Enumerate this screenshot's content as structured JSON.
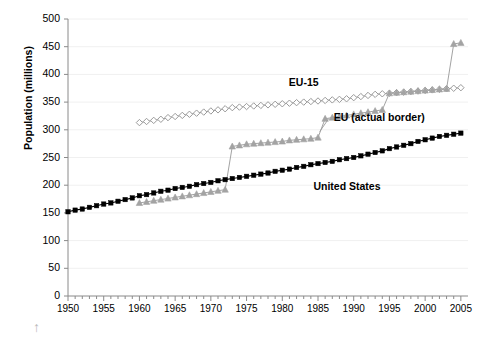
{
  "chart_data": {
    "type": "line",
    "title": "",
    "subtitle": "",
    "xlabel": "",
    "ylabel": "Population (millions)",
    "xlim": [
      1950,
      2006
    ],
    "ylim": [
      0,
      500
    ],
    "ytick_labels": [
      "0",
      "50",
      "100",
      "150",
      "200",
      "250",
      "300",
      "350",
      "400",
      "450",
      "500"
    ],
    "ytick_values": [
      0,
      50,
      100,
      150,
      200,
      250,
      300,
      350,
      400,
      450,
      500
    ],
    "xtick_labels": [
      "1950",
      "1955",
      "1960",
      "1965",
      "1970",
      "1975",
      "1980",
      "1985",
      "1990",
      "1995",
      "2000",
      "2005"
    ],
    "xtick_values": [
      1950,
      1955,
      1960,
      1965,
      1970,
      1975,
      1980,
      1985,
      1990,
      1995,
      2000,
      2005
    ],
    "grid": "horizontal",
    "legend": "inline-annotations",
    "series": [
      {
        "name": "EU-15",
        "marker": "open-diamond",
        "color": "#9a9a9a",
        "label_x": 1984,
        "label_y": 385,
        "x": [
          1960,
          1961,
          1962,
          1963,
          1964,
          1965,
          1966,
          1967,
          1968,
          1969,
          1970,
          1971,
          1972,
          1973,
          1974,
          1975,
          1976,
          1977,
          1978,
          1979,
          1980,
          1981,
          1982,
          1983,
          1984,
          1985,
          1986,
          1987,
          1988,
          1989,
          1990,
          1991,
          1992,
          1993,
          1994,
          1995,
          1996,
          1997,
          1998,
          1999,
          2000,
          2001,
          2002,
          2003,
          2004,
          2005
        ],
        "values": [
          313,
          315,
          317,
          319,
          322,
          324,
          326,
          328,
          330,
          332,
          334,
          336,
          338,
          340,
          341,
          342,
          343,
          344,
          345,
          346,
          347,
          348,
          349,
          350,
          351,
          352,
          353,
          354,
          355,
          356,
          358,
          360,
          362,
          364,
          365,
          366,
          367,
          368,
          369,
          370,
          371,
          372,
          373,
          374,
          375,
          376
        ]
      },
      {
        "name": "EU (actual border)",
        "marker": "filled-triangle",
        "color": "#a3a3a3",
        "label_x": 1990,
        "label_y": 322,
        "x": [
          1960,
          1961,
          1962,
          1963,
          1964,
          1965,
          1966,
          1967,
          1968,
          1969,
          1970,
          1971,
          1972,
          1973,
          1974,
          1975,
          1976,
          1977,
          1978,
          1979,
          1980,
          1981,
          1982,
          1983,
          1984,
          1985,
          1986,
          1987,
          1988,
          1989,
          1990,
          1991,
          1992,
          1993,
          1994,
          1995,
          1996,
          1997,
          1998,
          1999,
          2000,
          2001,
          2002,
          2003,
          2004,
          2005
        ],
        "values": [
          168,
          170,
          172,
          174,
          176,
          178,
          180,
          182,
          184,
          186,
          188,
          190,
          192,
          270,
          272,
          274,
          275,
          276,
          277,
          278,
          279,
          281,
          282,
          283,
          284,
          286,
          320,
          322,
          324,
          326,
          328,
          330,
          332,
          334,
          336,
          366,
          367,
          368,
          369,
          370,
          371,
          372,
          373,
          374,
          455,
          457
        ]
      },
      {
        "name": "United States",
        "marker": "filled-square",
        "color": "#000000",
        "label_x": 1988,
        "label_y": 196,
        "x": [
          1950,
          1951,
          1952,
          1953,
          1954,
          1955,
          1956,
          1957,
          1958,
          1959,
          1960,
          1961,
          1962,
          1963,
          1964,
          1965,
          1966,
          1967,
          1968,
          1969,
          1970,
          1971,
          1972,
          1973,
          1974,
          1975,
          1976,
          1977,
          1978,
          1979,
          1980,
          1981,
          1982,
          1983,
          1984,
          1985,
          1986,
          1987,
          1988,
          1989,
          1990,
          1991,
          1992,
          1993,
          1994,
          1995,
          1996,
          1997,
          1998,
          1999,
          2000,
          2001,
          2002,
          2003,
          2004,
          2005
        ],
        "values": [
          152,
          155,
          157,
          160,
          163,
          166,
          168,
          171,
          174,
          177,
          181,
          183,
          186,
          189,
          191,
          194,
          196,
          198,
          201,
          203,
          205,
          208,
          210,
          212,
          214,
          216,
          218,
          220,
          222,
          225,
          227,
          229,
          232,
          234,
          237,
          239,
          241,
          243,
          246,
          248,
          250,
          253,
          256,
          259,
          262,
          266,
          269,
          272,
          275,
          279,
          282,
          285,
          288,
          290,
          292,
          294
        ]
      }
    ]
  },
  "annotations": {
    "eu15": "EU-15",
    "eu_actual": "EU (actual border)",
    "us": "United States"
  },
  "misc": {
    "scroll_arrow": "↑"
  }
}
